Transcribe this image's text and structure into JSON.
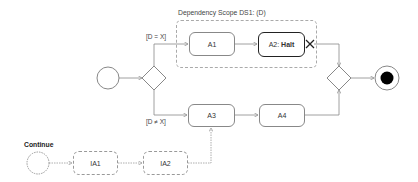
{
  "scope": {
    "label": "Dependency Scope DS1: (D)"
  },
  "guards": {
    "upper": "[D = X]",
    "lower": "[D ≠ X]"
  },
  "activities": {
    "a1": "A1",
    "a2_prefix": "A2: ",
    "a2_bold": "Halt",
    "a3": "A3",
    "a4": "A4",
    "ia1": "IA1",
    "ia2": "IA2"
  },
  "continue_label": "Continue",
  "icons": {
    "start": "initial-node-icon",
    "decision": "decision-diamond-icon",
    "merge": "merge-diamond-icon",
    "end": "final-node-icon",
    "halt": "flow-final-x-icon"
  },
  "colors": {
    "line": "#888888",
    "dotted_line": "#999999",
    "bold_border": "#222222",
    "end_fill": "#000000"
  }
}
